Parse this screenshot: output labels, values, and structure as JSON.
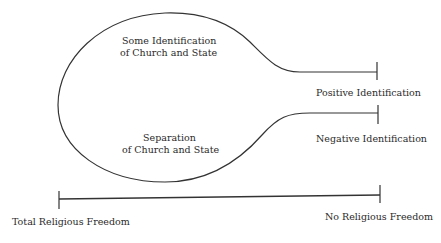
{
  "diagram": {
    "bulb": {
      "upper_label_line1": "Some Identification",
      "upper_label_line2": "of Church and State",
      "lower_label_line1": "Separation",
      "lower_label_line2": "of Church and State"
    },
    "stems": {
      "upper_end_label": "Positive Identification",
      "lower_end_label": "Negative Identification"
    },
    "axis": {
      "left_label": "Total Religious Freedom",
      "right_label": "No Religious Freedom"
    },
    "colors": {
      "line": "#333333",
      "text": "#2a2a2a",
      "background": "#ffffff"
    }
  }
}
